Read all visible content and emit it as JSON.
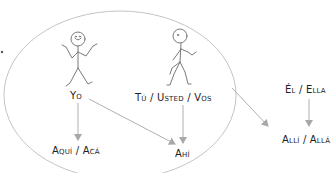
{
  "diagram": {
    "persons": {
      "first": {
        "label": "Yo"
      },
      "second": {
        "label": "Tú / Usted / Vos"
      },
      "third": {
        "label": "Él / Ella"
      }
    },
    "places": {
      "near_speaker": {
        "label": "Aquí / Acá"
      },
      "near_listener": {
        "label": "Ahí"
      },
      "far": {
        "label": "Allí / Allá"
      }
    },
    "colors": {
      "stroke": "#b0b0b0",
      "figure": "#7a7a7a",
      "text": "#222222",
      "background": "#ffffff"
    }
  }
}
